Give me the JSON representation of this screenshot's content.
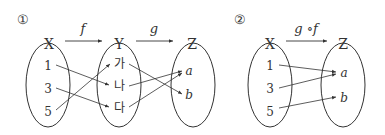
{
  "diagram1": {
    "number": "①",
    "set_x": {
      "label": "X",
      "elements": [
        "1",
        "3",
        "5"
      ]
    },
    "set_y": {
      "label": "Y",
      "elements": [
        "가",
        "나",
        "다"
      ]
    },
    "set_z": {
      "label": "Z",
      "elements": [
        "a",
        "b"
      ]
    },
    "f_label": "f",
    "g_label": "g",
    "f_mapping": {
      "1": "나",
      "3": "다",
      "5": "가"
    },
    "g_mapping": {
      "가": "b",
      "나": "a",
      "다": "a"
    }
  },
  "diagram2": {
    "number": "②",
    "set_x": {
      "label": "X",
      "elements": [
        "1",
        "3",
        "5"
      ]
    },
    "set_z": {
      "label": "Z",
      "elements": [
        "a",
        "b"
      ]
    },
    "composite_label": "g ∘f",
    "mapping": {
      "1": "a",
      "3": "a",
      "5": "b"
    }
  }
}
